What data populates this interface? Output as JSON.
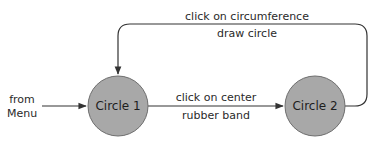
{
  "diagram": {
    "type": "state-transition",
    "colors": {
      "node_fill": "#a8a8a8",
      "node_stroke": "#6e6e6e",
      "edge": "#333333",
      "text": "#2a2a2a"
    },
    "entry": {
      "label_line1": "from",
      "label_line2": "Menu"
    },
    "nodes": [
      {
        "id": "circle1",
        "label": "Circle 1"
      },
      {
        "id": "circle2",
        "label": "Circle 2"
      }
    ],
    "edges": [
      {
        "from": "entry",
        "to": "circle1",
        "event": "",
        "action": ""
      },
      {
        "from": "circle1",
        "to": "circle2",
        "event": "click on center",
        "action": "rubber band"
      },
      {
        "from": "circle2",
        "to": "circle1",
        "event": "click on circumference",
        "action": "draw circle"
      }
    ]
  }
}
